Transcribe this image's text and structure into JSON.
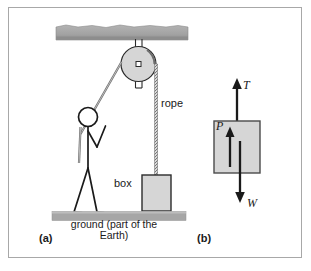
{
  "figure": {
    "panels": [
      {
        "id": "a",
        "label": "(a)",
        "caption_labels": {
          "rope": "rope",
          "box": "box",
          "ground": "ground (part of the Earth)"
        },
        "elements": [
          "ceiling-beam",
          "pulley",
          "pulley-bracket",
          "pulley-axle",
          "rope-pull-segment",
          "rope-hanging-segment",
          "stick-figure-person",
          "box",
          "ground-strip"
        ]
      },
      {
        "id": "b",
        "label": "(b)",
        "description": "free-body diagram of the box",
        "force_labels": {
          "tension": "T",
          "weight": "W",
          "pull": "P"
        },
        "forces": [
          {
            "symbol": "T",
            "direction": "up",
            "position": "above-box",
            "meaning": "tension"
          },
          {
            "symbol": "P",
            "direction": "up",
            "position": "inside-box",
            "meaning": "pull"
          },
          {
            "symbol": "W",
            "direction": "down",
            "position": "below-box",
            "meaning": "weight"
          }
        ]
      }
    ],
    "colors": {
      "frame_border": "#a8a8a8",
      "ink": "#1a1a1a",
      "shaded_gray": "#d4d4d4",
      "beam_gray": "#a6a6a6",
      "ground_gray": "#a6a6a6",
      "background": "#ffffff"
    }
  }
}
